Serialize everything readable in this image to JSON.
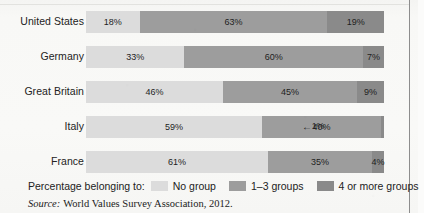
{
  "figure": {
    "background_color": "#f7f7f5",
    "frame_color": "#8d8d8d"
  },
  "legend": {
    "caption": "Percentage belonging to:",
    "items": [
      {
        "label": "No group",
        "color": "#dcdcdc"
      },
      {
        "label": "1–3 groups",
        "color": "#9d9d9d"
      },
      {
        "label": "4 or more groups",
        "color": "#8a8a8a"
      }
    ]
  },
  "source": {
    "label": "Source:",
    "text": "World Values Survey Association, 2012."
  },
  "chart_data": {
    "type": "bar",
    "orientation": "horizontal",
    "stacked": true,
    "normalized_percent": true,
    "title": "",
    "subtitle": "",
    "xlabel": "",
    "ylabel": "",
    "xlim": [
      0,
      100
    ],
    "grid": false,
    "legend_position": "bottom-left",
    "categories": [
      "United States",
      "Germany",
      "Great Britain",
      "Italy",
      "France"
    ],
    "series": [
      {
        "name": "No group",
        "color": "#dcdcdc",
        "values": [
          18,
          33,
          46,
          59,
          61
        ]
      },
      {
        "name": "1–3 groups",
        "color": "#9d9d9d",
        "values": [
          63,
          60,
          45,
          40,
          35
        ]
      },
      {
        "name": "4 or more groups",
        "color": "#8a8a8a",
        "values": [
          19,
          7,
          9,
          1,
          4
        ]
      }
    ],
    "rows": [
      {
        "category": "United States",
        "segments": [
          {
            "series": "No group",
            "value": 18,
            "label": "18%",
            "label_inside": true
          },
          {
            "series": "1–3 groups",
            "value": 63,
            "label": "63%",
            "label_inside": true
          },
          {
            "series": "4 or more groups",
            "value": 19,
            "label": "19%",
            "label_inside": true
          }
        ],
        "callout": null
      },
      {
        "category": "Germany",
        "segments": [
          {
            "series": "No group",
            "value": 33,
            "label": "33%",
            "label_inside": true
          },
          {
            "series": "1–3 groups",
            "value": 60,
            "label": "60%",
            "label_inside": true
          },
          {
            "series": "4 or more groups",
            "value": 7,
            "label": "7%",
            "label_inside": true
          }
        ],
        "callout": null
      },
      {
        "category": "Great Britain",
        "segments": [
          {
            "series": "No group",
            "value": 46,
            "label": "46%",
            "label_inside": true
          },
          {
            "series": "1–3 groups",
            "value": 45,
            "label": "45%",
            "label_inside": true
          },
          {
            "series": "4 or more groups",
            "value": 9,
            "label": "9%",
            "label_inside": true
          }
        ],
        "callout": null
      },
      {
        "category": "Italy",
        "segments": [
          {
            "series": "No group",
            "value": 59,
            "label": "59%",
            "label_inside": true
          },
          {
            "series": "1–3 groups",
            "value": 40,
            "label": "40%",
            "label_inside": true
          },
          {
            "series": "4 or more groups",
            "value": 1,
            "label": "1%",
            "label_inside": false
          }
        ],
        "callout": {
          "arrow": "←",
          "text": "1%"
        }
      },
      {
        "category": "France",
        "segments": [
          {
            "series": "No group",
            "value": 61,
            "label": "61%",
            "label_inside": true
          },
          {
            "series": "1–3 groups",
            "value": 35,
            "label": "35%",
            "label_inside": true
          },
          {
            "series": "4 or more groups",
            "value": 4,
            "label": "4%",
            "label_inside": true
          }
        ],
        "callout": null
      }
    ]
  }
}
